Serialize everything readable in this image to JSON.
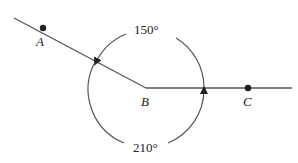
{
  "diagram": {
    "points": [
      {
        "name": "A",
        "x": 43,
        "y": 28
      },
      {
        "name": "B",
        "x": 146,
        "y": 88
      },
      {
        "name": "C",
        "x": 248,
        "y": 88
      }
    ],
    "rays": [
      {
        "from": "B",
        "through": "A"
      },
      {
        "from": "B",
        "through": "C"
      }
    ],
    "angles": [
      {
        "label": "150°",
        "direction": "counterclockwise",
        "from": "BC",
        "to": "BA",
        "position": "top"
      },
      {
        "label": "210°",
        "direction": "clockwise",
        "from": "BA",
        "to": "BC",
        "position": "bottom"
      }
    ],
    "colors": {
      "line": "#555555",
      "point": "#222222"
    }
  }
}
